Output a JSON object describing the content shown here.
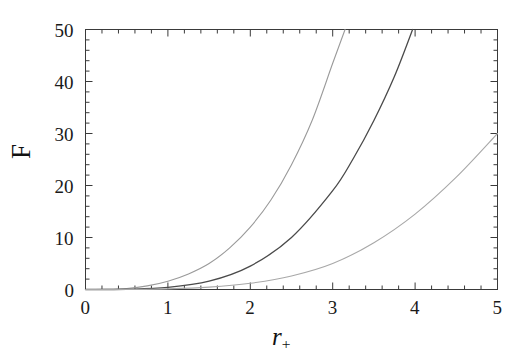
{
  "chart_data": {
    "type": "line",
    "title": "",
    "subtitle": "",
    "xlabel": "r",
    "xlabel_sub": "+",
    "ylabel": "F",
    "xlim": [
      0,
      5
    ],
    "ylim": [
      0,
      50
    ],
    "grid": false,
    "legend": null,
    "x_ticks": [
      0,
      1,
      2,
      3,
      4,
      5
    ],
    "x_tick_labels": [
      "0",
      "1",
      "2",
      "3",
      "4",
      "5"
    ],
    "x_minor_step": 0.2,
    "y_ticks": [
      0,
      10,
      20,
      30,
      40,
      50
    ],
    "y_tick_labels": [
      "0",
      "10",
      "20",
      "30",
      "40",
      "50"
    ],
    "y_minor_step": 2,
    "series": [
      {
        "name": "curve-1",
        "color": "#9a9a9a",
        "style": "solid",
        "width": 1.1,
        "x": [
          0,
          0.25,
          0.5,
          0.75,
          1.0,
          1.25,
          1.5,
          1.75,
          2.0,
          2.25,
          2.5,
          2.75,
          3.0,
          3.15
        ],
        "values": [
          0,
          0.03,
          0.2,
          0.7,
          1.6,
          3.0,
          5.0,
          8.0,
          12.0,
          17.2,
          24.0,
          32.5,
          43.5,
          50.0
        ]
      },
      {
        "name": "curve-2",
        "color": "#4a4a4a",
        "style": "solid",
        "width": 1.3,
        "x": [
          0,
          0.5,
          1.0,
          1.5,
          2.0,
          2.5,
          3.0,
          3.25,
          3.5,
          3.75,
          3.97
        ],
        "values": [
          0,
          0.05,
          0.4,
          1.6,
          4.5,
          10.0,
          19.0,
          25.2,
          32.5,
          41.0,
          50.0
        ]
      },
      {
        "name": "curve-3",
        "color": "#a8a8a8",
        "style": "solid",
        "width": 1.1,
        "x": [
          0,
          0.5,
          1.0,
          1.5,
          2.0,
          2.5,
          3.0,
          3.5,
          4.0,
          4.5,
          5.0
        ],
        "values": [
          0,
          0.02,
          0.12,
          0.45,
          1.2,
          2.6,
          5.0,
          9.0,
          14.5,
          21.6,
          30.0
        ]
      }
    ]
  },
  "axes": {
    "x_label_display": "r",
    "x_label_subscript": "+",
    "y_label_display": "F"
  }
}
